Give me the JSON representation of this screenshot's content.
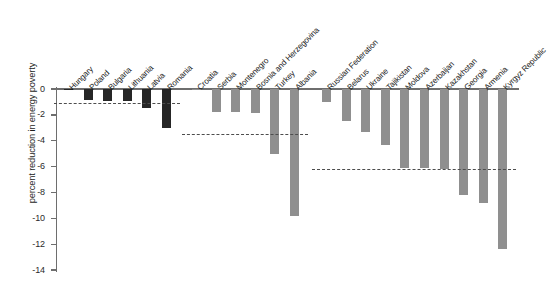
{
  "chart_data": {
    "type": "bar",
    "title": "",
    "subtitle": "",
    "xlabel": "",
    "ylabel": "percent reduction in energy poverty",
    "ylim": [
      -14,
      0
    ],
    "ytick_labels": [
      "0",
      "-2",
      "-4",
      "-6",
      "-8",
      "-10",
      "-12",
      "-14"
    ],
    "ytick_values": [
      0,
      -2,
      -4,
      -6,
      -8,
      -10,
      -12,
      -14
    ],
    "grid": false,
    "legend": "none",
    "orientation": "vertical",
    "colors": {
      "dark_bar": "#262626",
      "gray_bar": "#8f8f8f",
      "axis": "#6e6e6e",
      "mean_line": "#4d4d4d",
      "background": "#ffffff"
    },
    "categories": [
      "Hungary",
      "Poland",
      "Bulgaria",
      "Lithuania",
      "Latvia",
      "Romania",
      "Croatia",
      "Serbia",
      "Montenegro",
      "Bosnia and Herzegovina",
      "Turkey",
      "Albania",
      "Russian Federation",
      "Belarus",
      "Ukraine",
      "Tajikistan",
      "Moldova",
      "Azerbaijan",
      "Kazakhstan",
      "Georgia",
      "Armenia",
      "Kyrgyz Republic"
    ],
    "values": [
      -0.1,
      -0.85,
      -0.9,
      -0.95,
      -1.5,
      -3.05,
      -0.1,
      -1.8,
      -1.8,
      -1.85,
      -5.0,
      -9.8,
      -1.0,
      -2.5,
      -3.3,
      -4.3,
      -6.1,
      -6.1,
      -6.2,
      -8.2,
      -8.8,
      -12.4
    ],
    "bar_styles": [
      "dark",
      "dark",
      "dark",
      "dark",
      "dark",
      "dark",
      "gray",
      "gray",
      "gray",
      "gray",
      "gray",
      "gray",
      "gray",
      "gray",
      "gray",
      "gray",
      "gray",
      "gray",
      "gray",
      "gray",
      "gray",
      "gray"
    ],
    "groups": [
      {
        "name": "EU New Member States",
        "start_index": 0,
        "end_index": 5,
        "mean": -1.1
      },
      {
        "name": "South Eastern Europe",
        "start_index": 6,
        "end_index": 11,
        "mean": -3.5
      },
      {
        "name": "Commonwealth of Independent States",
        "start_index": 12,
        "end_index": 21,
        "mean": -6.2
      }
    ],
    "annotations": [
      {
        "type": "dashed-line",
        "label": "group average",
        "value": -1.1
      },
      {
        "type": "dashed-line",
        "label": "group average",
        "value": -3.5
      },
      {
        "type": "dashed-line",
        "label": "group average",
        "value": -6.2
      }
    ]
  }
}
